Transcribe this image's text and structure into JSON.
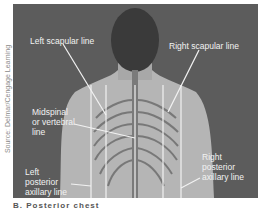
{
  "source_credit": "Source: Delmar/Cengage Learning",
  "labels": {
    "left_scapular": "Left scapular line",
    "right_scapular": "Right scapular line",
    "midspinal_1": "Midspinal",
    "midspinal_2": "or vertebral",
    "midspinal_3": "line",
    "left_post_1": "Left",
    "left_post_2": "posterior",
    "left_post_3": "axillary line",
    "right_post_1": "Right",
    "right_post_2": "posterior",
    "right_post_3": "axillary line"
  },
  "caption": "B. Posterior chest",
  "colors": {
    "background": "#5a5a5a",
    "skin": "#b8b8b8",
    "lines": "#f2f2f2"
  }
}
